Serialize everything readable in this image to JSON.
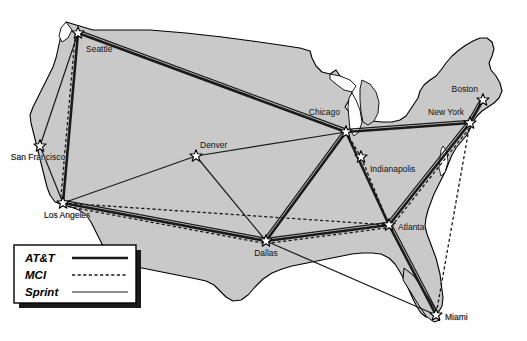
{
  "figure": {
    "background_color": "#ffffff",
    "land_fill": "#c9c9c9",
    "land_stroke": "#000000",
    "link_color": "#1a1a1a",
    "star_fill": "#ffffff",
    "star_stroke": "#000000"
  },
  "cities": [
    {
      "id": "seattle",
      "name": "Seattle",
      "x": 78,
      "y": 33,
      "label_x": 86,
      "label_y": 52,
      "anchor": "start"
    },
    {
      "id": "san_francisco",
      "name": "San Francisco",
      "x": 40,
      "y": 146,
      "label_x": 38,
      "label_y": 160,
      "anchor": "middle"
    },
    {
      "id": "los_angeles",
      "name": "Los Angeles",
      "x": 63,
      "y": 203,
      "label_x": 44,
      "label_y": 218,
      "anchor": "start"
    },
    {
      "id": "denver",
      "name": "Denver",
      "x": 196,
      "y": 156,
      "label_x": 200,
      "label_y": 148,
      "anchor": "start"
    },
    {
      "id": "dallas",
      "name": "Dallas",
      "x": 266,
      "y": 241,
      "label_x": 266,
      "label_y": 256,
      "anchor": "middle"
    },
    {
      "id": "chicago",
      "name": "Chicago",
      "x": 346,
      "y": 132,
      "label_x": 340,
      "label_y": 115,
      "anchor": "end"
    },
    {
      "id": "indianapolis",
      "name": "Indianapolis",
      "x": 361,
      "y": 157,
      "label_x": 370,
      "label_y": 172,
      "anchor": "start"
    },
    {
      "id": "atlanta",
      "name": "Atlanta",
      "x": 389,
      "y": 225,
      "label_x": 398,
      "label_y": 230,
      "anchor": "start"
    },
    {
      "id": "new_york",
      "name": "New York",
      "x": 470,
      "y": 123,
      "label_x": 464,
      "label_y": 115,
      "anchor": "end"
    },
    {
      "id": "boston",
      "name": "Boston",
      "x": 483,
      "y": 100,
      "label_x": 478,
      "label_y": 92,
      "anchor": "end"
    },
    {
      "id": "miami",
      "name": "Miami",
      "x": 436,
      "y": 315,
      "label_x": 445,
      "label_y": 320,
      "anchor": "start"
    }
  ],
  "carriers": [
    {
      "id": "att",
      "name": "AT&T",
      "style": "solid",
      "width": 2.6,
      "legend_order": 1
    },
    {
      "id": "mci",
      "name": "MCI",
      "style": "dashed",
      "width": 1.3,
      "legend_order": 2
    },
    {
      "id": "sprint",
      "name": "Sprint",
      "style": "solid",
      "width": 1.2,
      "legend_order": 3
    }
  ],
  "links": [
    {
      "carrier": "att",
      "from": "seattle",
      "to": "chicago",
      "offset": 0
    },
    {
      "carrier": "att",
      "from": "seattle",
      "to": "los_angeles",
      "offset": 0
    },
    {
      "carrier": "att",
      "from": "chicago",
      "to": "new_york",
      "offset": 0
    },
    {
      "carrier": "att",
      "from": "chicago",
      "to": "dallas",
      "offset": 0
    },
    {
      "carrier": "att",
      "from": "chicago",
      "to": "atlanta",
      "offset": 0
    },
    {
      "carrier": "att",
      "from": "los_angeles",
      "to": "dallas",
      "offset": 0
    },
    {
      "carrier": "att",
      "from": "dallas",
      "to": "atlanta",
      "offset": 0
    },
    {
      "carrier": "att",
      "from": "atlanta",
      "to": "new_york",
      "offset": 0
    },
    {
      "carrier": "att",
      "from": "atlanta",
      "to": "miami",
      "offset": 0
    },
    {
      "carrier": "att",
      "from": "new_york",
      "to": "boston",
      "offset": 0
    },
    {
      "carrier": "mci",
      "from": "seattle",
      "to": "los_angeles",
      "offset": 2.6
    },
    {
      "carrier": "mci",
      "from": "los_angeles",
      "to": "atlanta",
      "offset": 0
    },
    {
      "carrier": "mci",
      "from": "los_angeles",
      "to": "dallas",
      "offset": 2.6
    },
    {
      "carrier": "mci",
      "from": "dallas",
      "to": "atlanta",
      "offset": 2.6
    },
    {
      "carrier": "mci",
      "from": "chicago",
      "to": "indianapolis",
      "offset": 0
    },
    {
      "carrier": "mci",
      "from": "indianapolis",
      "to": "atlanta",
      "offset": 0
    },
    {
      "carrier": "mci",
      "from": "atlanta",
      "to": "new_york",
      "offset": 2.8
    },
    {
      "carrier": "mci",
      "from": "new_york",
      "to": "miami",
      "offset": 0
    },
    {
      "carrier": "sprint",
      "from": "seattle",
      "to": "san_francisco",
      "offset": 0
    },
    {
      "carrier": "sprint",
      "from": "seattle",
      "to": "chicago",
      "offset": -2.8
    },
    {
      "carrier": "sprint",
      "from": "san_francisco",
      "to": "los_angeles",
      "offset": 0
    },
    {
      "carrier": "sprint",
      "from": "los_angeles",
      "to": "denver",
      "offset": 0
    },
    {
      "carrier": "sprint",
      "from": "los_angeles",
      "to": "dallas",
      "offset": -2.6
    },
    {
      "carrier": "sprint",
      "from": "denver",
      "to": "chicago",
      "offset": 0
    },
    {
      "carrier": "sprint",
      "from": "dallas",
      "to": "denver",
      "offset": 0
    },
    {
      "carrier": "sprint",
      "from": "dallas",
      "to": "chicago",
      "offset": -2.6
    },
    {
      "carrier": "sprint",
      "from": "dallas",
      "to": "atlanta",
      "offset": -2.6
    },
    {
      "carrier": "sprint",
      "from": "dallas",
      "to": "miami",
      "offset": 0
    },
    {
      "carrier": "sprint",
      "from": "chicago",
      "to": "new_york",
      "offset": -2.6
    },
    {
      "carrier": "sprint",
      "from": "atlanta",
      "to": "new_york",
      "offset": -2.8
    },
    {
      "carrier": "sprint",
      "from": "atlanta",
      "to": "miami",
      "offset": -2.6
    },
    {
      "carrier": "sprint",
      "from": "new_york",
      "to": "boston",
      "offset": -2.6
    }
  ],
  "legend": {
    "x": 14,
    "y": 245,
    "width": 122,
    "height": 58,
    "shadow_offset": 5,
    "rows": [
      {
        "label": "AT&T",
        "carrier": "att",
        "sample_y": 258
      },
      {
        "label": "MCI",
        "carrier": "mci",
        "sample_y": 275
      },
      {
        "label": "Sprint",
        "carrier": "sprint",
        "sample_y": 292
      }
    ],
    "sample_x1": 72,
    "sample_x2": 128,
    "label_x": 25
  },
  "land_outline_path": "M 66,22 L 76,26 L 100,27 L 140,28 L 200,34 L 258,42 L 300,48 L 318,52 L 322,62 L 330,68 L 338,66 L 342,72 L 352,74 L 356,80 L 352,88 L 356,96 L 362,100 L 372,98 L 378,92 L 382,84 L 386,76 L 392,68 L 398,62 L 404,58 L 412,54 L 420,48 L 428,42 L 436,38 L 444,36 L 452,40 L 458,46 L 462,54 L 466,62 L 472,68 L 480,72 L 488,78 L 494,86 L 498,94 L 496,102 L 490,108 L 484,112 L 478,118 L 474,126 L 470,134 L 464,140 L 458,146 L 452,152 L 448,160 L 444,168 L 440,176 L 436,184 L 432,192 L 428,200 L 424,208 L 420,216 L 416,224 L 414,232 L 416,240 L 420,248 L 424,256 L 428,264 L 432,272 L 434,280 L 436,288 L 438,296 L 440,304 L 438,312 L 432,318 L 424,320 L 416,318 L 410,312 L 404,304 L 398,294 L 392,284 L 386,274 L 380,266 L 372,260 L 362,258 L 352,258 L 342,260 L 332,262 L 322,264 L 312,266 L 302,268 L 292,270 L 282,272 L 272,276 L 262,282 L 254,290 L 248,298 L 240,302 L 232,302 L 226,298 L 220,292 L 214,286 L 206,282 L 196,280 L 186,278 L 176,276 L 166,274 L 156,272 L 146,270 L 136,268 L 126,266 L 116,262 L 108,256 L 102,248 L 98,240 L 94,232 L 90,224 L 86,216 L 80,210 L 72,206 L 64,204 L 56,202 L 50,196 L 46,188 L 44,180 L 42,172 L 40,164 L 38,156 L 36,148 L 34,140 L 32,132 L 30,124 L 28,116 L 30,108 L 34,100 L 38,92 L 42,84 L 46,76 L 50,68 L 54,60 L 56,52 L 58,44 L 60,36 L 62,28 Z"
}
